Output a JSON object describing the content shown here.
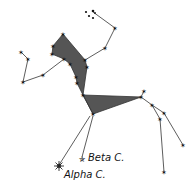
{
  "diagram": {
    "colors": {
      "line": "#333333",
      "fill": "#555555",
      "star": "#111111",
      "background": "#ffffff"
    },
    "labels": [
      {
        "id": "beta",
        "text": "Beta C.",
        "x": 88,
        "y": 152
      },
      {
        "id": "alpha",
        "text": "Alpha C.",
        "x": 64,
        "y": 169
      }
    ]
  }
}
